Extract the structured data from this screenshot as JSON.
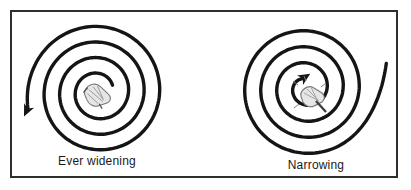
{
  "figure": {
    "background_color": "#ffffff",
    "border_color": "#2e2e2e",
    "line_color": "#151515",
    "sketch_color": "#8a8a8a",
    "panels": [
      {
        "label": "Ever widening",
        "spiral_kind": "widening",
        "arrow_position": "outer-end",
        "winding": "counterclockwise-outward"
      },
      {
        "label": "Narrowing",
        "spiral_kind": "narrowing",
        "arrow_position": "inner-end",
        "winding": "clockwise-inward"
      }
    ]
  }
}
